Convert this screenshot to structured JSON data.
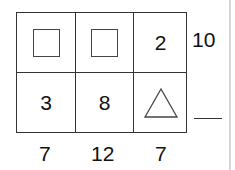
{
  "puzzle": {
    "cells": [
      {
        "row": 1,
        "col": 1,
        "type": "shape",
        "shape": "square",
        "value": null
      },
      {
        "row": 1,
        "col": 2,
        "type": "shape",
        "shape": "square",
        "value": null
      },
      {
        "row": 1,
        "col": 3,
        "type": "number",
        "value": "2"
      },
      {
        "row": 2,
        "col": 1,
        "type": "number",
        "value": "3"
      },
      {
        "row": 2,
        "col": 2,
        "type": "number",
        "value": "8"
      },
      {
        "row": 2,
        "col": 3,
        "type": "shape",
        "shape": "triangle",
        "value": null
      }
    ],
    "row_sums": [
      "10",
      ""
    ],
    "column_sums": [
      "7",
      "12",
      "7"
    ]
  }
}
